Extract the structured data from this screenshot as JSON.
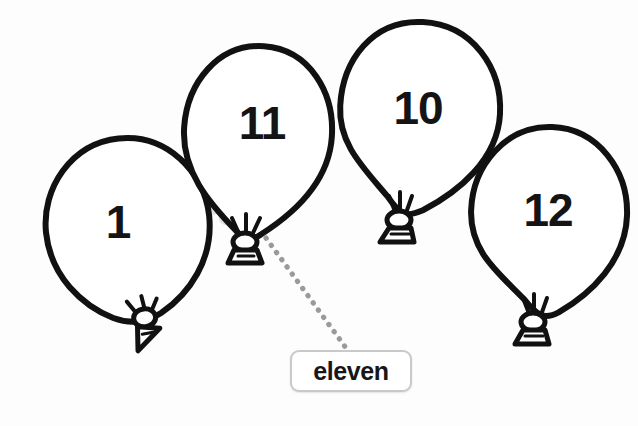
{
  "canvas": {
    "width": 638,
    "height": 426,
    "background": "#fdfdfd",
    "ink_color": "#111111",
    "dot_color": "#9a9a9a",
    "smudge_color": "#d6d6d6"
  },
  "worksheet": {
    "type": "number-to-word matching",
    "balloons": [
      {
        "id": "balloon-1",
        "number": "1",
        "cx": 128,
        "cy": 228,
        "rx": 82,
        "ry": 90,
        "label_x": 118,
        "label_y": 222,
        "font_size": 46,
        "knot_x": 143,
        "knot_y": 312,
        "rotation": -6,
        "selected": false
      },
      {
        "id": "balloon-11",
        "number": "11",
        "cx": 258,
        "cy": 132,
        "rx": 74,
        "ry": 86,
        "label_x": 262,
        "label_y": 123,
        "font_size": 46,
        "knot_x": 243,
        "knot_y": 240,
        "rotation": 4,
        "selected": true
      },
      {
        "id": "balloon-10",
        "number": "10",
        "cx": 420,
        "cy": 112,
        "rx": 80,
        "ry": 90,
        "label_x": 418,
        "label_y": 108,
        "font_size": 46,
        "knot_x": 398,
        "knot_y": 218,
        "rotation": 3,
        "selected": false
      },
      {
        "id": "balloon-12",
        "number": "12",
        "cx": 549,
        "cy": 215,
        "rx": 78,
        "ry": 90,
        "label_x": 548,
        "label_y": 210,
        "font_size": 46,
        "knot_x": 533,
        "knot_y": 320,
        "rotation": 2,
        "selected": false
      }
    ],
    "smudge": {
      "name": "eraser-smudge",
      "x": 208,
      "y": 170,
      "width": 48,
      "height": 44
    },
    "connector": {
      "name": "dotted-connector",
      "from_x": 266,
      "from_y": 238,
      "to_x": 346,
      "to_y": 348,
      "dot_radius": 2.6,
      "dot_count": 16,
      "color": "#9a9a9a"
    },
    "answer_label": {
      "text": "eleven",
      "x": 290,
      "y": 350,
      "width": 122,
      "height": 42,
      "border_color": "#c9c9c9",
      "text_color": "#171717"
    }
  }
}
